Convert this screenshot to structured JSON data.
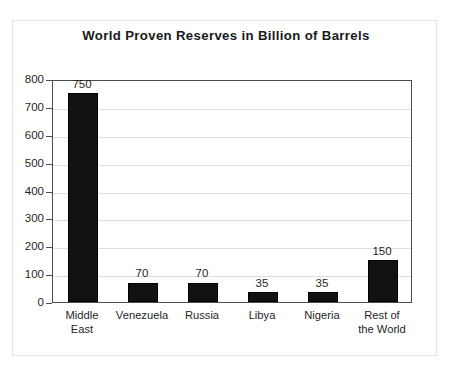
{
  "chart_data": {
    "type": "bar",
    "title": "World Proven Reserves in Billion of Barrels",
    "xlabel": "",
    "ylabel": "",
    "ylim": [
      0,
      800
    ],
    "ytick_step": 100,
    "yticks": [
      "800",
      "700",
      "600",
      "500",
      "400",
      "300",
      "200",
      "100",
      "0"
    ],
    "grid": true,
    "legend": "none",
    "categories": [
      "Middle\nEast",
      "Venezuela",
      "Russia",
      "Libya",
      "Nigeria",
      "Rest of\nthe World"
    ],
    "values": [
      750,
      70,
      70,
      35,
      35,
      150
    ],
    "data_labels": [
      "750",
      "70",
      "70",
      "35",
      "35",
      "150"
    ],
    "bar_color": "#111111",
    "grid_color": "#dedede",
    "axis_color": "#4d4d4d",
    "text_color": "#1f1f1f"
  }
}
